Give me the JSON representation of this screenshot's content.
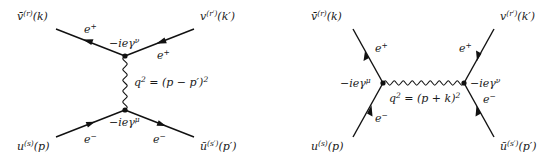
{
  "diagrams": [
    {
      "name": "t-channel",
      "external": {
        "top_left": {
          "base": "v̄",
          "sup": "(r)",
          "arg": "(k)"
        },
        "top_right": {
          "base": "v",
          "sup": "(r′)",
          "arg": "(k′)"
        },
        "bottom_left": {
          "base": "u",
          "sup": "(s)",
          "arg": "(p)"
        },
        "bottom_right": {
          "base": "ū",
          "sup": "(s′)",
          "arg": "(p′)"
        }
      },
      "particles": {
        "top_left": {
          "base": "e",
          "sup": "+"
        },
        "top_right": {
          "base": "e",
          "sup": "+"
        },
        "bottom_left": {
          "base": "e",
          "sup": "−"
        },
        "bottom_right": {
          "base": "e",
          "sup": "−"
        }
      },
      "vertices": {
        "top": {
          "base": "−ieγ",
          "sup": "ν"
        },
        "bottom": {
          "base": "−ieγ",
          "sup": "μ"
        }
      },
      "propagator": {
        "pre": "q",
        "sup": "2",
        "post": " = (p − p′)",
        "sup2": "2"
      }
    },
    {
      "name": "s-channel",
      "external": {
        "top_left": {
          "base": "v̄",
          "sup": "(r)",
          "arg": "(k)"
        },
        "top_right": {
          "base": "v",
          "sup": "(r′)",
          "arg": "(k′)"
        },
        "bottom_left": {
          "base": "u",
          "sup": "(s)",
          "arg": "(p)"
        },
        "bottom_right": {
          "base": "ū",
          "sup": "(s′)",
          "arg": "(p′)"
        }
      },
      "particles": {
        "top_left": {
          "base": "e",
          "sup": "+"
        },
        "top_right": {
          "base": "e",
          "sup": "+"
        },
        "bottom_left": {
          "base": "e",
          "sup": "−"
        },
        "bottom_right": {
          "base": "e",
          "sup": "−"
        }
      },
      "vertices": {
        "left": {
          "base": "−ieγ",
          "sup": "μ"
        },
        "right": {
          "base": "−ieγ",
          "sup": "ν"
        }
      },
      "propagator": {
        "pre": "q",
        "sup": "2",
        "post": " = (p + k)",
        "sup2": "2"
      }
    }
  ]
}
